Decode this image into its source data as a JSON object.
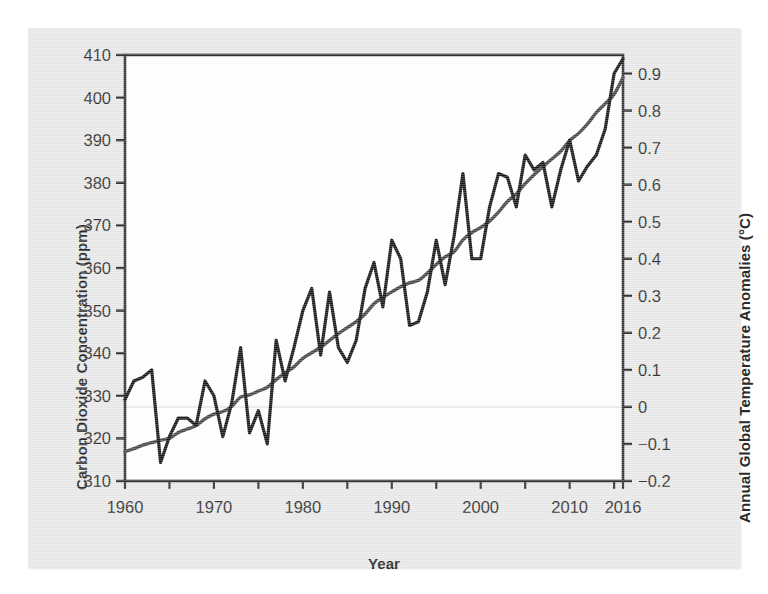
{
  "chart_data": {
    "type": "line",
    "title": "",
    "xlabel": "Year",
    "ylabel_left": "Carbon Dioxide Concentration (ppm)",
    "ylabel_right": "Annual Global Temperature Anomalies (°C)",
    "xlim": [
      1960,
      2016
    ],
    "xticks": [
      1960,
      1970,
      1980,
      1990,
      2000,
      2010,
      2016
    ],
    "xtick_labels": [
      "1960",
      "1970",
      "1980",
      "1990",
      "2000",
      "2010",
      "2016"
    ],
    "xminor_step": 5,
    "ylim_left": [
      310,
      410
    ],
    "yticks_left": [
      310,
      320,
      330,
      340,
      350,
      360,
      370,
      380,
      390,
      400,
      410
    ],
    "ytick_labels_left": [
      "310",
      "320",
      "330",
      "340",
      "350",
      "360",
      "370",
      "380",
      "390",
      "400",
      "410"
    ],
    "ylim_right": [
      -0.2,
      0.95
    ],
    "yticks_right": [
      -0.2,
      -0.1,
      0,
      0.1,
      0.2,
      0.3,
      0.4,
      0.5,
      0.6,
      0.7,
      0.8,
      0.9
    ],
    "ytick_labels_right": [
      "−0.2",
      "−0.1",
      "0",
      "0.1",
      "0.2",
      "0.3",
      "0.4",
      "0.5",
      "0.6",
      "0.7",
      "0.8",
      "0.9"
    ],
    "grid": false,
    "zero_line_value": 0,
    "legend": "none",
    "colors": {
      "co2_line": "#4a4a4a",
      "temperature_line": "#1a1a1a",
      "axis": "#333333",
      "plot_background": "#ffffff",
      "figure_background": "#e9e9e9",
      "zero_gridline": "#d8d8d8"
    },
    "series": [
      {
        "name": "Carbon Dioxide Concentration",
        "axis": "left",
        "unit": "ppm",
        "smooth": true,
        "x": [
          1960,
          1961,
          1962,
          1963,
          1964,
          1965,
          1966,
          1967,
          1968,
          1969,
          1970,
          1971,
          1972,
          1973,
          1974,
          1975,
          1976,
          1977,
          1978,
          1979,
          1980,
          1981,
          1982,
          1983,
          1984,
          1985,
          1986,
          1987,
          1988,
          1989,
          1990,
          1991,
          1992,
          1993,
          1994,
          1995,
          1996,
          1997,
          1998,
          1999,
          2000,
          2001,
          2002,
          2003,
          2004,
          2005,
          2006,
          2007,
          2008,
          2009,
          2010,
          2011,
          2012,
          2013,
          2014,
          2015,
          2016
        ],
        "values": [
          316.9,
          317.6,
          318.4,
          319.0,
          319.6,
          320.0,
          321.4,
          322.2,
          323.0,
          324.6,
          325.7,
          326.3,
          327.5,
          329.7,
          330.2,
          331.1,
          332.0,
          333.8,
          335.4,
          336.8,
          338.8,
          340.1,
          341.4,
          343.0,
          344.6,
          346.0,
          347.4,
          349.2,
          351.6,
          353.1,
          354.4,
          355.6,
          356.5,
          357.1,
          358.8,
          360.8,
          362.6,
          363.8,
          366.6,
          368.3,
          369.5,
          371.0,
          373.1,
          375.6,
          377.4,
          379.8,
          381.9,
          383.8,
          385.6,
          387.4,
          389.9,
          391.6,
          393.8,
          396.5,
          398.6,
          400.8,
          404.7
        ]
      },
      {
        "name": "Annual Global Temperature Anomalies",
        "axis": "right",
        "unit": "°C",
        "smooth": false,
        "x": [
          1960,
          1961,
          1962,
          1963,
          1964,
          1965,
          1966,
          1967,
          1968,
          1969,
          1970,
          1971,
          1972,
          1973,
          1974,
          1975,
          1976,
          1977,
          1978,
          1979,
          1980,
          1981,
          1982,
          1983,
          1984,
          1985,
          1986,
          1987,
          1988,
          1989,
          1990,
          1991,
          1992,
          1993,
          1994,
          1995,
          1996,
          1997,
          1998,
          1999,
          2000,
          2001,
          2002,
          2003,
          2004,
          2005,
          2006,
          2007,
          2008,
          2009,
          2010,
          2011,
          2012,
          2013,
          2014,
          2015,
          2016
        ],
        "values": [
          0.02,
          0.07,
          0.08,
          0.1,
          -0.15,
          -0.08,
          -0.03,
          -0.03,
          -0.05,
          0.07,
          0.03,
          -0.08,
          0.01,
          0.16,
          -0.07,
          -0.01,
          -0.1,
          0.18,
          0.07,
          0.16,
          0.26,
          0.32,
          0.14,
          0.31,
          0.16,
          0.12,
          0.18,
          0.32,
          0.39,
          0.27,
          0.45,
          0.4,
          0.22,
          0.23,
          0.31,
          0.45,
          0.33,
          0.46,
          0.63,
          0.4,
          0.4,
          0.54,
          0.63,
          0.62,
          0.54,
          0.68,
          0.64,
          0.66,
          0.54,
          0.64,
          0.72,
          0.61,
          0.65,
          0.68,
          0.75,
          0.9,
          0.94
        ]
      }
    ]
  },
  "axis_labels": {
    "left": "Carbon Dioxide Concentration (ppm)",
    "right": "Annual Global Temperature Anomalies (°C)",
    "bottom": "Year"
  }
}
